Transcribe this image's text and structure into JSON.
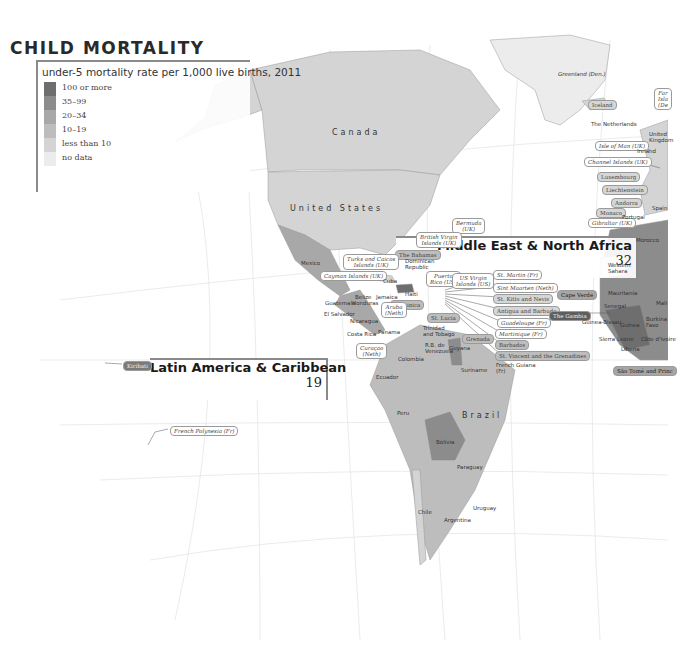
{
  "title": "CHILD MORTALITY",
  "legend": {
    "title": "under-5 mortality rate per 1,000 live births, 2011",
    "items": [
      {
        "label": "100 or more",
        "color": "#6e6e6e"
      },
      {
        "label": "35–99",
        "color": "#8c8c8c"
      },
      {
        "label": "20–34",
        "color": "#a8a8a8"
      },
      {
        "label": "10–19",
        "color": "#bdbdbd"
      },
      {
        "label": "less than 10",
        "color": "#d4d4d4"
      },
      {
        "label": "no data",
        "color": "#ececec"
      }
    ]
  },
  "regions": [
    {
      "name": "Middle East & North Africa",
      "value": "32"
    },
    {
      "name": "Latin America & Caribbean",
      "value": "19"
    }
  ],
  "big_labels": {
    "canada": "Canada",
    "united_states": "United States",
    "brazil": "Brazil",
    "greenland": "Greenland (Den.)"
  },
  "tags": [
    {
      "text": "Iceland",
      "cls": "c1",
      "x": 588,
      "y": 100
    },
    {
      "text": "Far\nIsla\n(De",
      "cls": "",
      "x": 654,
      "y": 88
    },
    {
      "text": "Isle of Man (UK)",
      "cls": "",
      "x": 595,
      "y": 141
    },
    {
      "text": "Channel Islands (UK)",
      "cls": "",
      "x": 584,
      "y": 157
    },
    {
      "text": "Luxembourg",
      "cls": "c1",
      "x": 597,
      "y": 172
    },
    {
      "text": "Liechtenstein",
      "cls": "c1",
      "x": 602,
      "y": 185
    },
    {
      "text": "Andorra",
      "cls": "c1",
      "x": 611,
      "y": 198
    },
    {
      "text": "Monaco",
      "cls": "c1",
      "x": 596,
      "y": 208
    },
    {
      "text": "Gibraltar (UK)",
      "cls": "",
      "x": 588,
      "y": 218
    },
    {
      "text": "Bermuda\n(UK)",
      "cls": "",
      "x": 452,
      "y": 218
    },
    {
      "text": "British Virgin\nIslands (UK)",
      "cls": "",
      "x": 416,
      "y": 232
    },
    {
      "text": "The Bahamas",
      "cls": "c2",
      "x": 395,
      "y": 250
    },
    {
      "text": "Turks and Caicos\nIslands (UK)",
      "cls": "",
      "x": 343,
      "y": 254
    },
    {
      "text": "Cayman Islands (UK)",
      "cls": "",
      "x": 320,
      "y": 271
    },
    {
      "text": "Puerto\nRico (US)",
      "cls": "",
      "x": 426,
      "y": 271
    },
    {
      "text": "US Virgin\nIslands (US)",
      "cls": "",
      "x": 452,
      "y": 273
    },
    {
      "text": "St. Martin (Fr)",
      "cls": "",
      "x": 493,
      "y": 270
    },
    {
      "text": "Sint Maarten (Neth)",
      "cls": "",
      "x": 493,
      "y": 283
    },
    {
      "text": "St. Kitts and Nevis",
      "cls": "c1",
      "x": 493,
      "y": 294
    },
    {
      "text": "Antigua and Barbuda",
      "cls": "c1",
      "x": 493,
      "y": 306
    },
    {
      "text": "Guadeloupe (Fr)",
      "cls": "",
      "x": 497,
      "y": 318
    },
    {
      "text": "Martinique (Fr)",
      "cls": "",
      "x": 495,
      "y": 329
    },
    {
      "text": "Barbados",
      "cls": "c2",
      "x": 495,
      "y": 340
    },
    {
      "text": "St. Vincent and the Grenadines",
      "cls": "c2",
      "x": 495,
      "y": 351
    },
    {
      "text": "Dominica",
      "cls": "c2",
      "x": 390,
      "y": 300
    },
    {
      "text": "Aruba\n(Neth)",
      "cls": "",
      "x": 381,
      "y": 302
    },
    {
      "text": "St. Lucia",
      "cls": "c2",
      "x": 427,
      "y": 313
    },
    {
      "text": "Grenada",
      "cls": "c2",
      "x": 462,
      "y": 334
    },
    {
      "text": "Curaçao\n(Neth)",
      "cls": "",
      "x": 356,
      "y": 343
    },
    {
      "text": "Cape Verde",
      "cls": "c3",
      "x": 557,
      "y": 290
    },
    {
      "text": "The Gambia",
      "cls": "c5",
      "x": 549,
      "y": 311
    },
    {
      "text": "São Tomé and Princ",
      "cls": "c3",
      "x": 613,
      "y": 366
    },
    {
      "text": "Kiribati",
      "cls": "c4",
      "x": 123,
      "y": 361
    },
    {
      "text": "French Polynesia (Fr)",
      "cls": "",
      "x": 170,
      "y": 426
    }
  ],
  "plain_labels": [
    {
      "text": "The Netherlands",
      "x": 591,
      "y": 121
    },
    {
      "text": "United\nKingdom",
      "x": 649,
      "y": 131
    },
    {
      "text": "Ireland",
      "x": 637,
      "y": 148
    },
    {
      "text": "Spain",
      "x": 652,
      "y": 205
    },
    {
      "text": "Portugal",
      "x": 622,
      "y": 214
    },
    {
      "text": "Morocco",
      "x": 636,
      "y": 237
    },
    {
      "text": "Western\nSahara",
      "x": 608,
      "y": 262
    },
    {
      "text": "Mauritania",
      "x": 608,
      "y": 290
    },
    {
      "text": "Mali",
      "x": 656,
      "y": 300
    },
    {
      "text": "Senegal",
      "x": 604,
      "y": 303
    },
    {
      "text": "Guinea-Bissau",
      "x": 582,
      "y": 319
    },
    {
      "text": "Guinea",
      "x": 620,
      "y": 322
    },
    {
      "text": "Burkina\nFaso",
      "x": 646,
      "y": 316
    },
    {
      "text": "Sierra Leone",
      "x": 599,
      "y": 336
    },
    {
      "text": "Côte d'Ivoire",
      "x": 641,
      "y": 336
    },
    {
      "text": "Liberia",
      "x": 621,
      "y": 346
    },
    {
      "text": "Mexico",
      "x": 301,
      "y": 260
    },
    {
      "text": "Cuba",
      "x": 383,
      "y": 278
    },
    {
      "text": "Dominican\nRepublic",
      "x": 405,
      "y": 258
    },
    {
      "text": "Haiti",
      "x": 405,
      "y": 291
    },
    {
      "text": "Belize",
      "x": 355,
      "y": 294
    },
    {
      "text": "Jamaica",
      "x": 376,
      "y": 294
    },
    {
      "text": "Guatemala",
      "x": 325,
      "y": 300
    },
    {
      "text": "Honduras",
      "x": 352,
      "y": 300
    },
    {
      "text": "El Salvador",
      "x": 324,
      "y": 311
    },
    {
      "text": "Nicaragua",
      "x": 350,
      "y": 318
    },
    {
      "text": "Costa Rica",
      "x": 347,
      "y": 331
    },
    {
      "text": "Panama",
      "x": 378,
      "y": 329
    },
    {
      "text": "Trinidad\nand Tobago",
      "x": 423,
      "y": 325
    },
    {
      "text": "R.B. de\nVenezuela",
      "x": 425,
      "y": 342
    },
    {
      "text": "Guyana",
      "x": 449,
      "y": 345
    },
    {
      "text": "Suriname",
      "x": 461,
      "y": 367
    },
    {
      "text": "French Guiana\n(Fr)",
      "x": 496,
      "y": 362
    },
    {
      "text": "Colombia",
      "x": 398,
      "y": 356
    },
    {
      "text": "Ecuador",
      "x": 376,
      "y": 374
    },
    {
      "text": "Peru",
      "x": 397,
      "y": 410
    },
    {
      "text": "Bolivia",
      "x": 436,
      "y": 439
    },
    {
      "text": "Paraguay",
      "x": 457,
      "y": 464
    },
    {
      "text": "Uruguay",
      "x": 473,
      "y": 505
    },
    {
      "text": "Chile",
      "x": 418,
      "y": 509
    },
    {
      "text": "Argentina",
      "x": 444,
      "y": 517
    }
  ]
}
